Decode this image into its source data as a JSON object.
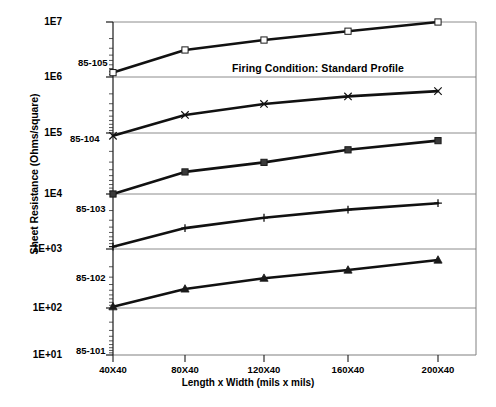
{
  "chart_data": {
    "type": "line",
    "title": "",
    "xlabel": "Length x Width  (mils x mils)",
    "ylabel": "Sheet Resistance  (Ohms/square)",
    "yscale": "log",
    "ylim": [
      10,
      10000000
    ],
    "grid": true,
    "legend_position": "inline-labels",
    "categories": [
      "40X40",
      "80X40",
      "120X40",
      "160X40",
      "200X40"
    ],
    "ytick_labels": [
      "1E7",
      "1E6",
      "1E5",
      "1E4",
      "1E+03",
      "1E+02",
      "1E+01"
    ],
    "ytick_values": [
      10000000,
      1000000,
      100000,
      10000,
      1000,
      100,
      10
    ],
    "annotations": [
      {
        "text": "Firing Condition: Standard Profile",
        "x": 232,
        "y": 62
      }
    ],
    "series": [
      {
        "name": "85-105",
        "marker": "open-square",
        "label_x": 78,
        "label_y": 57,
        "values": [
          1200000,
          3100000,
          4700000,
          6800000,
          10000000
        ]
      },
      {
        "name": "85-104",
        "marker": "cross",
        "label_x": 70,
        "label_y": 133,
        "values": [
          90000,
          210000,
          330000,
          450000,
          560000
        ]
      },
      {
        "name": "85-103",
        "marker": "filled-square",
        "label_x": 76,
        "label_y": 203,
        "values": [
          10000,
          23000,
          33000,
          53000,
          75000
        ]
      },
      {
        "name": "85-102",
        "marker": "plus",
        "label_x": 76,
        "label_y": 272,
        "values": [
          1100,
          2400,
          3700,
          5200,
          6800
        ]
      },
      {
        "name": "85-101",
        "marker": "filled-triangle",
        "label_x": 76,
        "label_y": 345,
        "values": [
          105,
          210,
          320,
          440,
          650
        ]
      }
    ]
  },
  "axis": {
    "y_title": "Sheet Resistance  (Ohms/square)",
    "x_title": "Length x Width  (mils x mils)"
  }
}
